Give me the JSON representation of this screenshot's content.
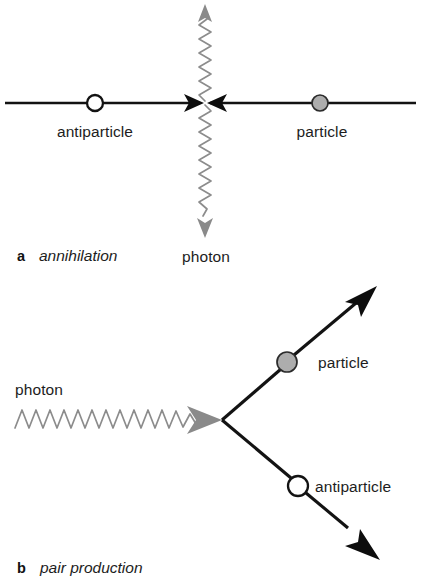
{
  "figure": {
    "colors": {
      "line": "#131313",
      "wave": "#8c8c8c",
      "arrow_dark": "#0d0d0d",
      "arrow_gray": "#8a8a8a",
      "particle_fill": "#adadad",
      "antiparticle_fill": "#ffffff",
      "background": "#ffffff"
    }
  },
  "panel_a": {
    "caption_letter": "a",
    "caption_text": "annihilation",
    "labels": {
      "antiparticle": "antiparticle",
      "particle": "particle",
      "photon": "photon"
    },
    "nodes": {
      "antiparticle": {
        "cx": 95,
        "cy": 103,
        "r": 8,
        "style": "open-circle"
      },
      "particle": {
        "cx": 320,
        "cy": 103,
        "r": 8,
        "style": "filled-circle"
      },
      "vertex": {
        "x": 205,
        "y": 103
      }
    },
    "photon_up": {
      "from_y": 103,
      "to_y": 6,
      "direction": "up"
    },
    "photon_down": {
      "from_y": 103,
      "to_y": 237,
      "direction": "down"
    }
  },
  "panel_b": {
    "caption_letter": "b",
    "caption_text": "pair production",
    "labels": {
      "photon": "photon",
      "particle": "particle",
      "antiparticle": "antiparticle"
    },
    "nodes": {
      "particle": {
        "cx": 287,
        "cy": 362,
        "r": 10,
        "style": "filled-circle"
      },
      "antiparticle": {
        "cx": 298,
        "cy": 486,
        "r": 10,
        "style": "open-circle"
      },
      "vertex": {
        "x": 222,
        "y": 420
      }
    },
    "photon_in": {
      "from_x": 15,
      "to_x": 222,
      "y": 420,
      "direction": "right"
    },
    "particle_out": {
      "to_x": 376,
      "to_y": 288
    },
    "antiparticle_out": {
      "to_x": 379,
      "to_y": 559
    }
  }
}
